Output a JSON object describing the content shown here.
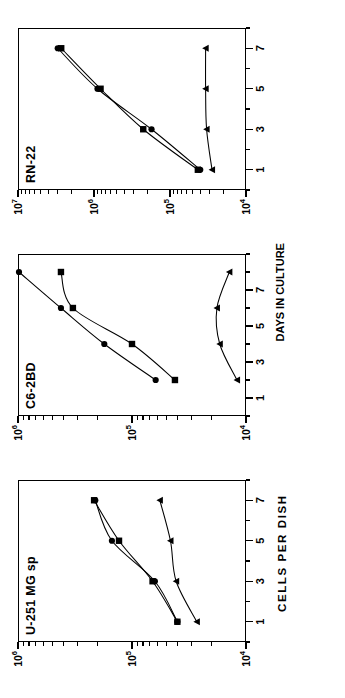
{
  "figure": {
    "y_axis_title": "CELLS PER DISH",
    "x_axis_title": "DAYS IN CULTURE"
  },
  "chart_data": [
    {
      "type": "line",
      "title": "U-251 MG sp",
      "xlabel": "DAYS IN CULTURE",
      "ylabel": "CELLS PER DISH",
      "yscale": "log",
      "ylim": [
        10000,
        1000000
      ],
      "ytick_labels": [
        "10⁴",
        "10⁵",
        "10⁶"
      ],
      "ytick_values": [
        10000,
        100000,
        1000000
      ],
      "xlim": [
        0,
        8
      ],
      "xtick_labels": [
        "1",
        "3",
        "5",
        "7"
      ],
      "xtick_values": [
        1,
        3,
        5,
        7
      ],
      "grid": false,
      "legend": "none",
      "series": [
        {
          "name": "circle",
          "marker": "circle",
          "x": [
            1,
            3,
            5,
            7
          ],
          "values": [
            40000,
            63000,
            150000,
            210000
          ]
        },
        {
          "name": "square",
          "marker": "square",
          "x": [
            1,
            3,
            5,
            7
          ],
          "values": [
            40000,
            66000,
            130000,
            215000
          ]
        },
        {
          "name": "triangle",
          "marker": "triangle",
          "x": [
            1,
            3,
            5,
            7
          ],
          "values": [
            27000,
            41000,
            46000,
            57000
          ]
        }
      ]
    },
    {
      "type": "line",
      "title": "C6-2BD",
      "xlabel": "DAYS IN CULTURE",
      "ylabel": "CELLS PER DISH",
      "yscale": "log",
      "ylim": [
        10000,
        1000000
      ],
      "ytick_labels": [
        "10⁴",
        "10⁵",
        "10⁶"
      ],
      "ytick_values": [
        10000,
        100000,
        1000000
      ],
      "xlim": [
        0,
        9
      ],
      "xtick_labels": [
        "1",
        "3",
        "5",
        "7"
      ],
      "xtick_values": [
        1,
        3,
        5,
        7
      ],
      "grid": false,
      "legend": "none",
      "series": [
        {
          "name": "circle",
          "marker": "circle",
          "x": [
            2,
            4,
            6,
            8
          ],
          "values": [
            62000,
            175000,
            420000,
            980000
          ]
        },
        {
          "name": "square",
          "marker": "square",
          "x": [
            2,
            4,
            6,
            8
          ],
          "values": [
            42000,
            100000,
            330000,
            420000
          ]
        },
        {
          "name": "triangle",
          "marker": "triangle",
          "x": [
            2,
            4,
            6,
            8
          ],
          "values": [
            12000,
            17000,
            18000,
            14000
          ]
        }
      ]
    },
    {
      "type": "line",
      "title": "RN-22",
      "xlabel": "DAYS IN CULTURE",
      "ylabel": "CELLS PER DISH",
      "yscale": "log",
      "ylim": [
        10000,
        10000000
      ],
      "ytick_labels": [
        "10⁴",
        "10⁵",
        "10⁶",
        "10⁷"
      ],
      "ytick_values": [
        10000,
        100000,
        1000000,
        10000000
      ],
      "xlim": [
        0,
        8
      ],
      "xtick_labels": [
        "1",
        "3",
        "5",
        "7"
      ],
      "xtick_values": [
        1,
        3,
        5,
        7
      ],
      "grid": false,
      "legend": "none",
      "series": [
        {
          "name": "circle",
          "marker": "circle",
          "x": [
            1,
            3,
            5,
            7
          ],
          "values": [
            40000,
            175000,
            900000,
            3000000
          ]
        },
        {
          "name": "square",
          "marker": "square",
          "x": [
            1,
            3,
            5,
            7
          ],
          "values": [
            43000,
            225000,
            820000,
            2700000
          ]
        },
        {
          "name": "triangle",
          "marker": "triangle",
          "x": [
            1,
            3,
            5,
            7
          ],
          "values": [
            28000,
            33000,
            34000,
            34000
          ]
        }
      ]
    }
  ]
}
